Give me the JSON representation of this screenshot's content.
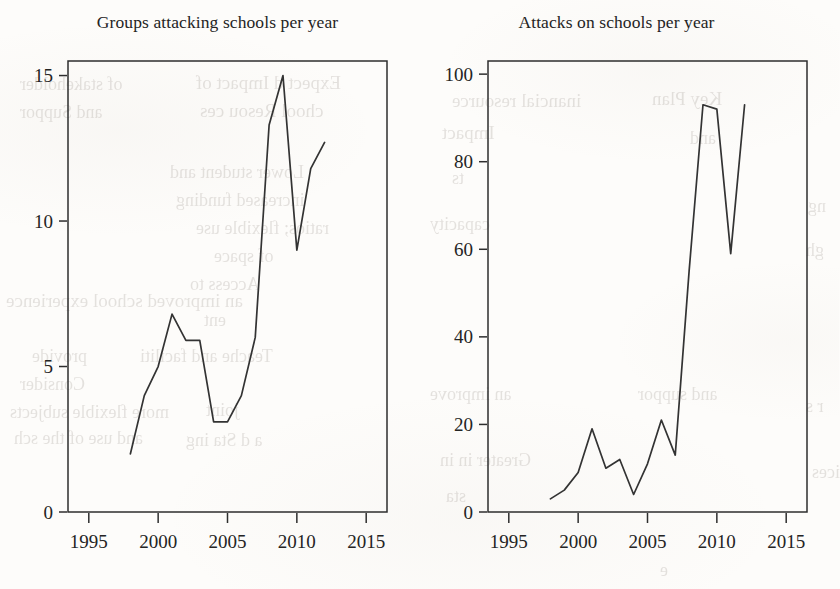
{
  "page": {
    "background_color": "#fdfcfa",
    "ink_color": "#2e2e2e",
    "kind": "scanned-book-figure"
  },
  "figure": {
    "panels": [
      {
        "id": "groups-attacking-schools",
        "title": "Groups attacking schools per year"
      },
      {
        "id": "attacks-on-schools",
        "title": "Attacks on schools per year"
      }
    ]
  },
  "ghost_text": [
    {
      "text": "Expect d Impact of",
      "x": 196,
      "y": 72,
      "size": 19
    },
    {
      "text": "chool Resou ces",
      "x": 200,
      "y": 100,
      "size": 19
    },
    {
      "text": "of stakeholder",
      "x": 20,
      "y": 74,
      "size": 18
    },
    {
      "text": "and Suppor",
      "x": 20,
      "y": 102,
      "size": 18
    },
    {
      "text": "Lower student and",
      "x": 170,
      "y": 162,
      "size": 18
    },
    {
      "text": "increased funding",
      "x": 176,
      "y": 190,
      "size": 18
    },
    {
      "text": "ratios; flexible use",
      "x": 196,
      "y": 218,
      "size": 18
    },
    {
      "text": "of space",
      "x": 214,
      "y": 246,
      "size": 18
    },
    {
      "text": "Access to",
      "x": 190,
      "y": 274,
      "size": 18
    },
    {
      "text": "an improved school experience",
      "x": 6,
      "y": 290,
      "size": 19
    },
    {
      "text": "ent",
      "x": 204,
      "y": 310,
      "size": 18
    },
    {
      "text": "Teache and faciliti",
      "x": 140,
      "y": 346,
      "size": 18
    },
    {
      "text": "provide",
      "x": 32,
      "y": 346,
      "size": 18
    },
    {
      "text": "more flexible subjects",
      "x": 10,
      "y": 402,
      "size": 18
    },
    {
      "text": "joint",
      "x": 206,
      "y": 400,
      "size": 18
    },
    {
      "text": "Consider",
      "x": 20,
      "y": 374,
      "size": 18
    },
    {
      "text": "and use of the sch",
      "x": 14,
      "y": 428,
      "size": 18
    },
    {
      "text": "a  d Sta  ing",
      "x": 186,
      "y": 430,
      "size": 18
    },
    {
      "text": "inancial resource",
      "x": 452,
      "y": 90,
      "size": 19
    },
    {
      "text": "Key Plan",
      "x": 652,
      "y": 88,
      "size": 19
    },
    {
      "text": "Impact",
      "x": 442,
      "y": 122,
      "size": 19
    },
    {
      "text": "and",
      "x": 690,
      "y": 128,
      "size": 18
    },
    {
      "text": "ts",
      "x": 452,
      "y": 168,
      "size": 18
    },
    {
      "text": "capacity",
      "x": 430,
      "y": 214,
      "size": 18
    },
    {
      "text": "ng",
      "x": 808,
      "y": 196,
      "size": 18
    },
    {
      "text": "gh",
      "x": 806,
      "y": 240,
      "size": 18
    },
    {
      "text": "an improve",
      "x": 430,
      "y": 384,
      "size": 18
    },
    {
      "text": "and suppor",
      "x": 638,
      "y": 384,
      "size": 18
    },
    {
      "text": "r s",
      "x": 806,
      "y": 396,
      "size": 18
    },
    {
      "text": "Greater in          in",
      "x": 440,
      "y": 450,
      "size": 18
    },
    {
      "text": "ices",
      "x": 812,
      "y": 462,
      "size": 18
    },
    {
      "text": "sta",
      "x": 446,
      "y": 486,
      "size": 18
    },
    {
      "text": "e",
      "x": 660,
      "y": 560,
      "size": 18
    }
  ],
  "chart_data": [
    {
      "type": "line",
      "id": "groups-attacking-schools",
      "title": "Groups attacking schools per year",
      "xlabel": "",
      "ylabel": "",
      "xlim": [
        1993.5,
        2016.5
      ],
      "ylim": [
        0,
        15.5
      ],
      "grid": false,
      "legend": false,
      "xticks": [
        1995,
        2000,
        2005,
        2010,
        2015
      ],
      "xticklabels": [
        "1995",
        "2000",
        "2005",
        "2010",
        "2015"
      ],
      "yticks": [
        0,
        5,
        10,
        15
      ],
      "yticklabels": [
        "0",
        "5",
        "10",
        "15"
      ],
      "x": [
        1998,
        1999,
        2000,
        2001,
        2002,
        2003,
        2004,
        2005,
        2006,
        2007,
        2008,
        2009,
        2010,
        2011,
        2012
      ],
      "values": [
        2,
        4,
        5,
        6.8,
        5.9,
        5.9,
        3.1,
        3.1,
        4,
        6,
        13.3,
        15,
        9,
        11.8,
        12.7
      ]
    },
    {
      "type": "line",
      "id": "attacks-on-schools",
      "title": "Attacks on schools per year",
      "xlabel": "",
      "ylabel": "",
      "xlim": [
        1993.5,
        2016.5
      ],
      "ylim": [
        0,
        103
      ],
      "grid": false,
      "legend": false,
      "xticks": [
        1995,
        2000,
        2005,
        2010,
        2015
      ],
      "xticklabels": [
        "1995",
        "2000",
        "2005",
        "2010",
        "2015"
      ],
      "yticks": [
        0,
        20,
        40,
        60,
        80,
        100
      ],
      "yticklabels": [
        "0",
        "20",
        "40",
        "60",
        "80",
        "100"
      ],
      "x": [
        1998,
        1999,
        2000,
        2001,
        2002,
        2003,
        2004,
        2005,
        2006,
        2007,
        2008,
        2009,
        2010,
        2011,
        2012
      ],
      "values": [
        3,
        5,
        9,
        19,
        10,
        12,
        4,
        11,
        21,
        13,
        55,
        93,
        92,
        59,
        93
      ]
    }
  ]
}
